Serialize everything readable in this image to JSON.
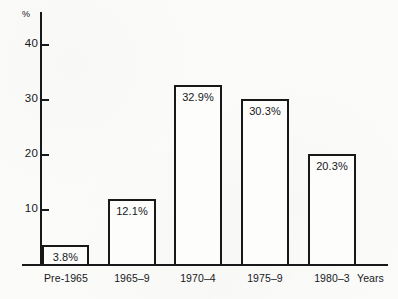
{
  "chart_data": {
    "type": "bar",
    "title": "",
    "xlabel": "Years",
    "ylabel": "%",
    "categories": [
      "Pre-1965",
      "1965–9",
      "1970–4",
      "1975–9",
      "1980–3"
    ],
    "values": [
      3.8,
      12.1,
      32.9,
      30.3,
      20.3
    ],
    "value_labels": [
      "3.8%",
      "12.1%",
      "32.9%",
      "30.3%",
      "20.3%"
    ],
    "ylim": [
      0,
      44
    ],
    "y_ticks": [
      10,
      20,
      30,
      40
    ],
    "y_tick_labels": [
      "10",
      "20",
      "30",
      "40"
    ],
    "grid": false,
    "legend": false,
    "bar_style": "outlined",
    "colors": {
      "stroke": "#17181a",
      "bar_fill": "#fdfdfc",
      "background": "#fbfbfa"
    }
  }
}
